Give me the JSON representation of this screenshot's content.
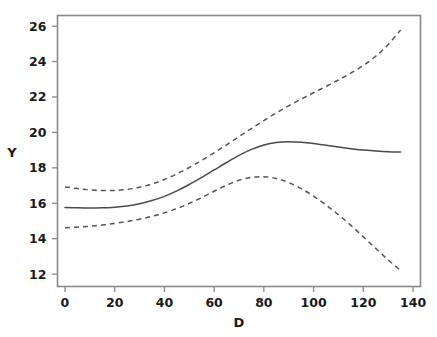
{
  "figure": {
    "width": 437,
    "height": 337,
    "background": "#ffffff"
  },
  "chart_data": {
    "type": "line",
    "title": "",
    "subtitle": "",
    "xlabel": "D",
    "ylabel": "Y",
    "xlim": [
      -3,
      143
    ],
    "ylim": [
      11.3,
      26.6
    ],
    "xticks": [
      0,
      20,
      40,
      60,
      80,
      100,
      120,
      140
    ],
    "xtick_labels": [
      "0",
      "20",
      "40",
      "60",
      "80",
      "100",
      "120",
      "140"
    ],
    "yticks": [
      12,
      14,
      16,
      18,
      20,
      22,
      24,
      26
    ],
    "ytick_labels": [
      "12",
      "14",
      "16",
      "18",
      "20",
      "22",
      "24",
      "26"
    ],
    "grid": false,
    "legend": "none",
    "frame_color": "#8a8a8a",
    "line_color": "#4a4a4a",
    "series": [
      {
        "name": "upper-confidence-band",
        "style": "dashed",
        "color": "#555555",
        "x": [
          0,
          5,
          10,
          15,
          20,
          25,
          30,
          35,
          40,
          45,
          50,
          55,
          60,
          65,
          70,
          75,
          80,
          85,
          90,
          95,
          100,
          105,
          110,
          115,
          120,
          125,
          130,
          135
        ],
        "y": [
          16.92,
          16.83,
          16.76,
          16.72,
          16.72,
          16.78,
          16.9,
          17.09,
          17.34,
          17.66,
          18.02,
          18.42,
          18.85,
          19.3,
          19.76,
          20.22,
          20.67,
          21.1,
          21.5,
          21.88,
          22.24,
          22.6,
          22.96,
          23.35,
          23.78,
          24.3,
          24.96,
          25.78
        ]
      },
      {
        "name": "fitted-line",
        "style": "solid",
        "color": "#4a4a4a",
        "x": [
          0,
          5,
          10,
          15,
          20,
          25,
          30,
          35,
          40,
          45,
          50,
          55,
          60,
          65,
          70,
          75,
          80,
          85,
          90,
          95,
          100,
          105,
          110,
          115,
          120,
          125,
          130,
          135
        ],
        "y": [
          15.76,
          15.74,
          15.73,
          15.74,
          15.78,
          15.85,
          15.97,
          16.15,
          16.39,
          16.7,
          17.06,
          17.46,
          17.88,
          18.3,
          18.7,
          19.04,
          19.29,
          19.43,
          19.47,
          19.44,
          19.37,
          19.27,
          19.17,
          19.08,
          19.0,
          18.95,
          18.91,
          18.89
        ]
      },
      {
        "name": "lower-confidence-band",
        "style": "dashed",
        "color": "#555555",
        "x": [
          0,
          5,
          10,
          15,
          20,
          25,
          30,
          35,
          40,
          45,
          50,
          55,
          60,
          65,
          70,
          75,
          80,
          85,
          90,
          95,
          100,
          105,
          110,
          115,
          120,
          125,
          130,
          135
        ],
        "y": [
          14.62,
          14.65,
          14.7,
          14.77,
          14.86,
          14.97,
          15.1,
          15.26,
          15.46,
          15.7,
          15.99,
          16.32,
          16.68,
          17.02,
          17.3,
          17.46,
          17.5,
          17.4,
          17.17,
          16.83,
          16.4,
          15.9,
          15.35,
          14.75,
          14.1,
          13.45,
          12.8,
          12.2
        ]
      }
    ]
  }
}
